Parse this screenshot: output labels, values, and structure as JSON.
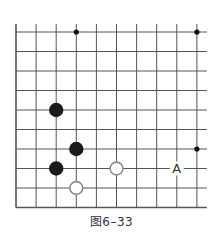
{
  "diagram": {
    "type": "go-board-fragment",
    "grid": {
      "cols": 10,
      "rows": 10,
      "origin_x": 16,
      "origin_y": 32,
      "spacing_x": 20.1,
      "spacing_y": 19.5,
      "line_color": "#555555"
    },
    "open_edges": [
      "top",
      "right"
    ],
    "star_points": [
      {
        "col": 3,
        "row": 0
      },
      {
        "col": 9,
        "row": 0
      },
      {
        "col": 9,
        "row": 6
      }
    ],
    "stones": [
      {
        "color": "black",
        "col": 2,
        "row": 4
      },
      {
        "color": "black",
        "col": 3,
        "row": 6
      },
      {
        "color": "black",
        "col": 2,
        "row": 7
      },
      {
        "color": "white",
        "col": 5,
        "row": 7
      },
      {
        "color": "white",
        "col": 3,
        "row": 8
      }
    ],
    "labels": [
      {
        "text": "A",
        "col": 8,
        "row": 7
      }
    ],
    "colors": {
      "black_stone": "#1a1a1a",
      "white_stone_fill": "#ffffff",
      "white_stone_stroke": "#8a8a8a",
      "star": "#111111"
    }
  },
  "caption": "图6–33"
}
